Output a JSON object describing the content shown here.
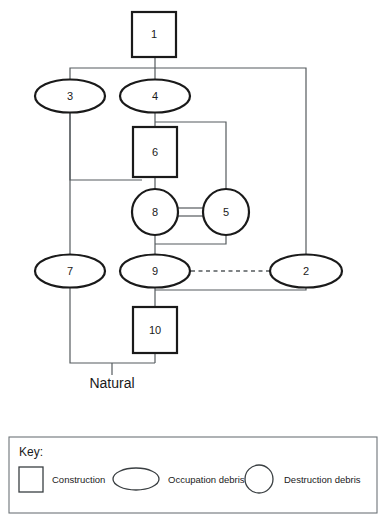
{
  "diagram": {
    "type": "harris-matrix",
    "title": "",
    "base_label": "Natural",
    "nodes": [
      {
        "id": "n1",
        "label": "1",
        "shape": "box",
        "cx": 154,
        "cy": 34,
        "w": 44,
        "h": 45
      },
      {
        "id": "n3",
        "label": "3",
        "shape": "ellipse",
        "cx": 70,
        "cy": 96,
        "w": 70,
        "h": 33
      },
      {
        "id": "n4",
        "label": "4",
        "shape": "ellipse",
        "cx": 155,
        "cy": 96,
        "w": 70,
        "h": 33
      },
      {
        "id": "n6",
        "label": "6",
        "shape": "box",
        "cx": 155,
        "cy": 152,
        "w": 44,
        "h": 50
      },
      {
        "id": "n8",
        "label": "8",
        "shape": "circle",
        "cx": 155,
        "cy": 212,
        "r": 23
      },
      {
        "id": "n5",
        "label": "5",
        "shape": "circle",
        "cx": 226,
        "cy": 212,
        "r": 23
      },
      {
        "id": "n7",
        "label": "7",
        "shape": "ellipse",
        "cx": 70,
        "cy": 271,
        "w": 70,
        "h": 33
      },
      {
        "id": "n9",
        "label": "9",
        "shape": "ellipse",
        "cx": 155,
        "cy": 271,
        "w": 70,
        "h": 33
      },
      {
        "id": "n2",
        "label": "2",
        "shape": "ellipse",
        "cx": 306,
        "cy": 271,
        "w": 72,
        "h": 33
      },
      {
        "id": "n10",
        "label": "10",
        "shape": "box",
        "cx": 155,
        "cy": 330,
        "w": 44,
        "h": 46
      }
    ],
    "edges": [
      {
        "from": "n1",
        "to": "n4",
        "style": "solid"
      },
      {
        "from": "n1",
        "to": "n3",
        "style": "solid"
      },
      {
        "from": "n1",
        "to": "n2",
        "style": "solid"
      },
      {
        "from": "n4",
        "to": "n6",
        "style": "solid"
      },
      {
        "from": "n4",
        "to": "n5",
        "style": "solid"
      },
      {
        "from": "n6",
        "to": "n8",
        "style": "solid"
      },
      {
        "from": "n3",
        "to": "n6",
        "style": "solid"
      },
      {
        "from": "n3",
        "to": "n7",
        "style": "solid"
      },
      {
        "from": "n8",
        "to": "n5",
        "style": "correlation"
      },
      {
        "from": "n8",
        "to": "n9",
        "style": "solid"
      },
      {
        "from": "n5",
        "to": "n9",
        "style": "solid"
      },
      {
        "from": "n9",
        "to": "n2",
        "style": "dashed"
      },
      {
        "from": "n2",
        "to": "n10",
        "style": "solid"
      },
      {
        "from": "n9",
        "to": "n10",
        "style": "solid"
      },
      {
        "from": "n10",
        "to": "natural",
        "style": "solid"
      },
      {
        "from": "n7",
        "to": "natural",
        "style": "solid"
      }
    ]
  },
  "key": {
    "title": "Key:",
    "items": [
      {
        "shape": "square",
        "label": "Construction"
      },
      {
        "shape": "ellipse",
        "label": "Occupation debris"
      },
      {
        "shape": "circle",
        "label": "Destruction debris"
      }
    ]
  },
  "colors": {
    "shape_stroke": "#1a1a1a",
    "link_stroke": "#555b5e",
    "key_frame": "#6d7478",
    "background": "#ffffff"
  }
}
